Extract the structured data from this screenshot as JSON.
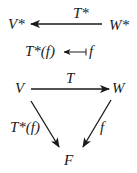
{
  "diagram": {
    "top": {
      "source": "W*",
      "target": "V*",
      "arrow_label": "T*",
      "mapsto": {
        "from": "f",
        "to": "T*(f)"
      }
    },
    "triangle": {
      "V": "V",
      "W": "W",
      "F": "F",
      "edges": [
        {
          "from": "V",
          "to": "W",
          "label": "T"
        },
        {
          "from": "V",
          "to": "F",
          "label": "T*(f)"
        },
        {
          "from": "W",
          "to": "F",
          "label": "f"
        }
      ]
    },
    "colors": {
      "ink": "#1a1a1a",
      "background": "#ffffff"
    }
  }
}
